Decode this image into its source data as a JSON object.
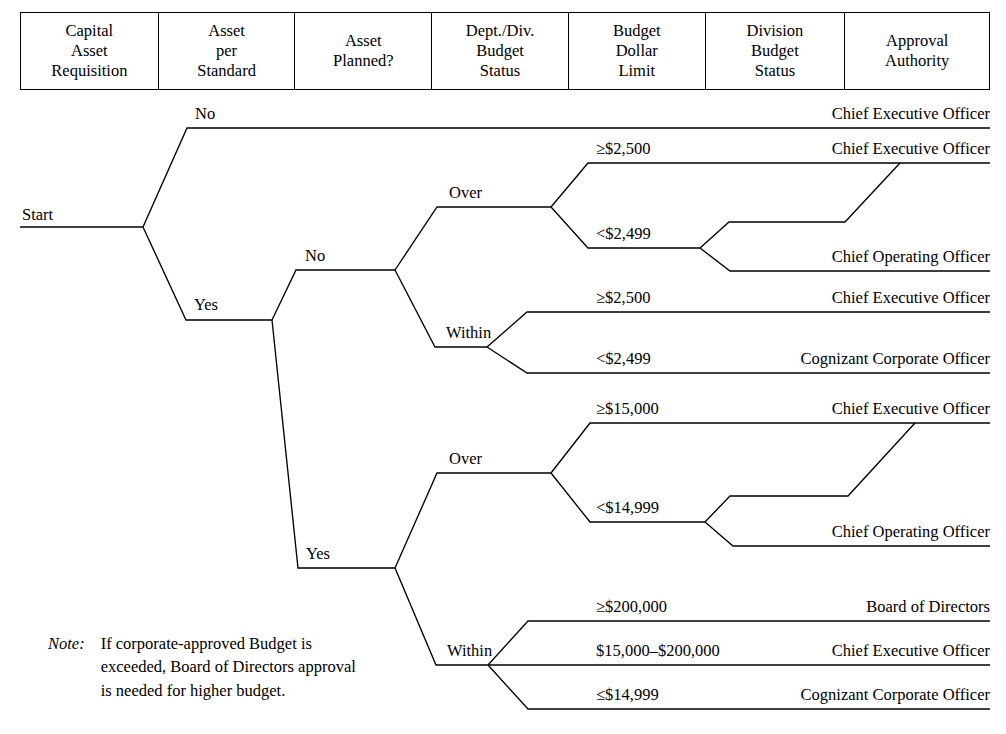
{
  "header": {
    "columns": [
      {
        "lines": [
          "Capital",
          "Asset",
          "Requisition"
        ],
        "width": 138
      },
      {
        "lines": [
          "Asset",
          "per",
          "Standard"
        ],
        "width": 137
      },
      {
        "lines": [
          "Asset",
          "Planned?"
        ],
        "width": 137
      },
      {
        "lines": [
          "Dept./Div.",
          "Budget",
          "Status"
        ],
        "width": 137
      },
      {
        "lines": [
          "Budget",
          "Dollar",
          "Limit"
        ],
        "width": 137
      },
      {
        "lines": [
          "Division",
          "Budget",
          "Status"
        ],
        "width": 140
      },
      {
        "lines": [
          "Approval",
          "Authority"
        ],
        "width": 144
      }
    ]
  },
  "tree": {
    "start_label": "Start",
    "branch_labels": {
      "standard_no": "No",
      "standard_yes": "Yes",
      "planned_no": "No",
      "planned_yes": "Yes",
      "budget_over_1": "Over",
      "budget_within_1": "Within",
      "budget_over_2": "Over",
      "budget_within_2": "Within"
    },
    "dollar_limits": {
      "no_over_high": "≥$2,500",
      "no_over_low": "<$2,499",
      "no_within_high": "≥$2,500",
      "no_within_low": "<$2,499",
      "yes_over_high": "≥$15,000",
      "yes_over_low": "<$14,999",
      "yes_within_high": "≥$200,000",
      "yes_within_mid": "$15,000–$200,000",
      "yes_within_low": "≤$14,999"
    },
    "approval_authorities": {
      "not_per_standard": "Chief Executive Officer",
      "no_over_high": "Chief Executive Officer",
      "no_over_low": "Chief Operating Officer",
      "no_within_high": "Chief Executive Officer",
      "no_within_low": "Cognizant Corporate Officer",
      "yes_over_high": "Chief Executive Officer",
      "yes_over_low": "Chief Operating Officer",
      "yes_within_high": "Board of Directors",
      "yes_within_mid": "Chief Executive Officer",
      "yes_within_low": "Cognizant Corporate Officer"
    }
  },
  "note": {
    "word": "Note:",
    "lines": [
      "If corporate-approved Budget is",
      "exceeded, Board of Directors approval",
      "is needed for higher budget."
    ]
  },
  "colors": {
    "line": "#000000",
    "background": "#ffffff",
    "text": "#000000"
  }
}
